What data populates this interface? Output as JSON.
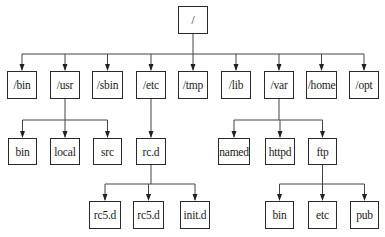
{
  "diagram": {
    "type": "directory-tree",
    "line_color": "#444444",
    "box_border_color": "#2a2a2a",
    "root": {
      "id": "root",
      "label": "/",
      "x": 178,
      "y": 6,
      "w": 30,
      "h": 28
    },
    "nodes": [
      {
        "id": "bin",
        "label": "/bin",
        "x": 7,
        "y": 71,
        "w": 30,
        "h": 28,
        "parent": "root"
      },
      {
        "id": "usr",
        "label": "/usr",
        "x": 50,
        "y": 71,
        "w": 30,
        "h": 28,
        "parent": "root"
      },
      {
        "id": "sbin",
        "label": "/sbin",
        "x": 92,
        "y": 71,
        "w": 31,
        "h": 28,
        "parent": "root"
      },
      {
        "id": "etc",
        "label": "/etc",
        "x": 136,
        "y": 71,
        "w": 30,
        "h": 28,
        "parent": "root"
      },
      {
        "id": "tmp",
        "label": "/tmp",
        "x": 178,
        "y": 71,
        "w": 30,
        "h": 28,
        "parent": "root"
      },
      {
        "id": "lib",
        "label": "/lib",
        "x": 221,
        "y": 71,
        "w": 30,
        "h": 28,
        "parent": "root"
      },
      {
        "id": "var",
        "label": "/var",
        "x": 264,
        "y": 71,
        "w": 30,
        "h": 28,
        "parent": "root"
      },
      {
        "id": "home",
        "label": "/home",
        "x": 306,
        "y": 71,
        "w": 31,
        "h": 28,
        "parent": "root"
      },
      {
        "id": "opt",
        "label": "/opt",
        "x": 349,
        "y": 71,
        "w": 30,
        "h": 28,
        "parent": "root"
      },
      {
        "id": "usr_bin",
        "label": "bin",
        "x": 8,
        "y": 138,
        "w": 29,
        "h": 27,
        "parent": "usr"
      },
      {
        "id": "usr_local",
        "label": "local",
        "x": 50,
        "y": 138,
        "w": 30,
        "h": 27,
        "parent": "usr"
      },
      {
        "id": "usr_src",
        "label": "src",
        "x": 93,
        "y": 138,
        "w": 29,
        "h": 27,
        "parent": "usr"
      },
      {
        "id": "etc_rcd",
        "label": "rc.d",
        "x": 136,
        "y": 138,
        "w": 30,
        "h": 27,
        "parent": "etc"
      },
      {
        "id": "var_named",
        "label": "named",
        "x": 218,
        "y": 138,
        "w": 32,
        "h": 27,
        "parent": "var"
      },
      {
        "id": "var_httpd",
        "label": "httpd",
        "x": 265,
        "y": 138,
        "w": 30,
        "h": 27,
        "parent": "var"
      },
      {
        "id": "var_ftp",
        "label": "ftp",
        "x": 308,
        "y": 138,
        "w": 29,
        "h": 27,
        "parent": "var"
      },
      {
        "id": "rc5d_1",
        "label": "rc5.d",
        "x": 89,
        "y": 201,
        "w": 32,
        "h": 28,
        "parent": "etc_rcd"
      },
      {
        "id": "rc5d_2",
        "label": "rc5.d",
        "x": 133,
        "y": 201,
        "w": 31,
        "h": 28,
        "parent": "etc_rcd"
      },
      {
        "id": "initd",
        "label": "init.d",
        "x": 180,
        "y": 201,
        "w": 30,
        "h": 28,
        "parent": "etc_rcd"
      },
      {
        "id": "ftp_bin",
        "label": "bin",
        "x": 265,
        "y": 201,
        "w": 29,
        "h": 28,
        "parent": "var_ftp"
      },
      {
        "id": "ftp_etc",
        "label": "etc",
        "x": 308,
        "y": 201,
        "w": 29,
        "h": 28,
        "parent": "var_ftp"
      },
      {
        "id": "ftp_pub",
        "label": "pub",
        "x": 350,
        "y": 201,
        "w": 29,
        "h": 28,
        "parent": "var_ftp"
      }
    ]
  }
}
